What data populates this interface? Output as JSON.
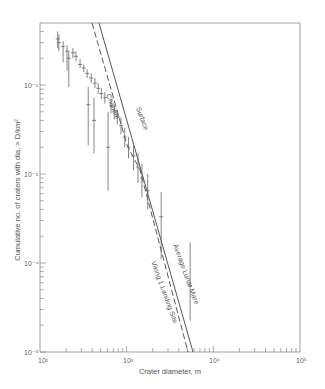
{
  "chart_data": {
    "type": "scatter",
    "title": "",
    "xlabel": "Crater diameter, m",
    "ylabel": "Cumulative no. of craters with dia. > D/km²",
    "xscale": "log",
    "yscale": "log",
    "xlim": [
      100,
      100000
    ],
    "ylim": [
      1e-05,
      0.05
    ],
    "grid": false,
    "x_ticks": [
      {
        "value": 100,
        "label": "10²"
      },
      {
        "value": 1000,
        "label": "10³"
      },
      {
        "value": 10000,
        "label": "10⁴"
      },
      {
        "value": 100000,
        "label": "10⁵"
      }
    ],
    "y_ticks": [
      {
        "value": 0.01,
        "label": "10⁻²"
      },
      {
        "value": 0.001,
        "label": "10⁻³"
      },
      {
        "value": 0.0001,
        "label": "10⁻⁴"
      },
      {
        "value": 1e-05,
        "label": "10⁻⁵"
      }
    ],
    "series": [
      {
        "name": "Surface",
        "kind": "line",
        "style": "solid",
        "points": [
          [
            460,
            0.05
          ],
          [
            5900,
            1e-05
          ]
        ]
      },
      {
        "name": "Channel",
        "kind": "line",
        "style": "dashed",
        "points": [
          [
            380,
            0.05
          ],
          [
            980,
            0.0021
          ],
          [
            1380,
            0.0011
          ],
          [
            5300,
            1e-05
          ]
        ]
      },
      {
        "name": "Average Lunar Mare",
        "kind": "label-only",
        "note": "label placed along the solid line segment"
      },
      {
        "name": "Viking 1 Landing Site",
        "kind": "label-only",
        "note": "label placed along the dashed line segment"
      },
      {
        "name": "Crater counts",
        "kind": "errorbar",
        "points": [
          {
            "x": 160,
            "y": 0.033,
            "low": 0.026,
            "high": 0.04
          },
          {
            "x": 165,
            "y": 0.03,
            "low": 0.024,
            "high": 0.037
          },
          {
            "x": 185,
            "y": 0.027,
            "low": 0.018,
            "high": 0.031
          },
          {
            "x": 205,
            "y": 0.024,
            "low": 0.0145,
            "high": 0.028
          },
          {
            "x": 215,
            "y": 0.02,
            "low": 0.0095,
            "high": 0.024
          },
          {
            "x": 240,
            "y": 0.023,
            "low": 0.02,
            "high": 0.026
          },
          {
            "x": 260,
            "y": 0.021,
            "low": 0.0185,
            "high": 0.024
          },
          {
            "x": 290,
            "y": 0.017,
            "low": 0.0155,
            "high": 0.0195
          },
          {
            "x": 320,
            "y": 0.0155,
            "low": 0.014,
            "high": 0.017
          },
          {
            "x": 350,
            "y": 0.0135,
            "low": 0.012,
            "high": 0.015
          },
          {
            "x": 360,
            "y": 0.006,
            "low": 0.0021,
            "high": 0.0095
          },
          {
            "x": 390,
            "y": 0.012,
            "low": 0.0105,
            "high": 0.0135
          },
          {
            "x": 420,
            "y": 0.004,
            "low": 0.0017,
            "high": 0.0072
          },
          {
            "x": 430,
            "y": 0.0105,
            "low": 0.0092,
            "high": 0.012
          },
          {
            "x": 470,
            "y": 0.0092,
            "low": 0.008,
            "high": 0.0105
          },
          {
            "x": 510,
            "y": 0.008,
            "low": 0.007,
            "high": 0.0092
          },
          {
            "x": 560,
            "y": 0.0072,
            "low": 0.0062,
            "high": 0.0083
          },
          {
            "x": 610,
            "y": 0.002,
            "low": 0.00065,
            "high": 0.005
          },
          {
            "x": 660,
            "y": 0.0058,
            "low": 0.0048,
            "high": 0.0068
          },
          {
            "x": 720,
            "y": 0.005,
            "low": 0.0041,
            "high": 0.006
          },
          {
            "x": 780,
            "y": 0.0044,
            "low": 0.0036,
            "high": 0.0052
          },
          {
            "x": 860,
            "y": 0.0035,
            "low": 0.0028,
            "high": 0.0043
          },
          {
            "x": 950,
            "y": 0.0026,
            "low": 0.002,
            "high": 0.0033
          },
          {
            "x": 1050,
            "y": 0.002,
            "low": 0.0015,
            "high": 0.0026
          },
          {
            "x": 1200,
            "y": 0.0016,
            "low": 0.0011,
            "high": 0.0021
          },
          {
            "x": 1350,
            "y": 0.0012,
            "low": 0.0008,
            "high": 0.0017
          },
          {
            "x": 1500,
            "y": 0.0009,
            "low": 0.00055,
            "high": 0.0013
          },
          {
            "x": 1750,
            "y": 0.00065,
            "low": 0.0004,
            "high": 0.001
          },
          {
            "x": 2500,
            "y": 0.00033,
            "low": 0.00011,
            "high": 0.00063
          },
          {
            "x": 5400,
            "y": 5.5e-05,
            "low": 2.25e-05,
            "high": 0.00017
          }
        ]
      }
    ],
    "annotations": [
      {
        "text": "Surface",
        "rotation": 68
      },
      {
        "text": "Channel",
        "rotation": 68
      },
      {
        "text": "Average Lunar Mare",
        "rotation": 70
      },
      {
        "text": "Viking 1 Landing Site",
        "rotation": 70
      }
    ]
  },
  "labels": {
    "xlabel": "Crater diameter, m",
    "ylabel": "Cumulative no. of craters with dia. > D/km²",
    "x_ticks": [
      "10²",
      "10³",
      "10⁴",
      "10⁵"
    ],
    "y_ticks": [
      "10⁻²",
      "10⁻³",
      "10⁻⁴",
      "10⁻⁵"
    ],
    "surface": "Surface",
    "channel": "Channel",
    "lunar_mare": "Average Lunar Mare",
    "viking": "Viking 1 Landing Site"
  }
}
